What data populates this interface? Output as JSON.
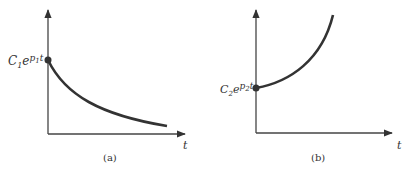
{
  "figure": {
    "panels": [
      {
        "caption": "(a)",
        "x_label": "t",
        "value_label_main": "C",
        "value_label_sub1": "1",
        "value_label_e": "e",
        "value_label_p": "p",
        "value_label_sub2": "1",
        "value_label_t": "t",
        "curve": "decaying exponential"
      },
      {
        "caption": "(b)",
        "x_label": "t",
        "value_label_main": "C",
        "value_label_sub1": "2",
        "value_label_e": "e",
        "value_label_p": "p",
        "value_label_sub2": "2",
        "value_label_t": "t",
        "curve": "growing exponential"
      }
    ]
  },
  "colors": {
    "ink": "#333333"
  }
}
